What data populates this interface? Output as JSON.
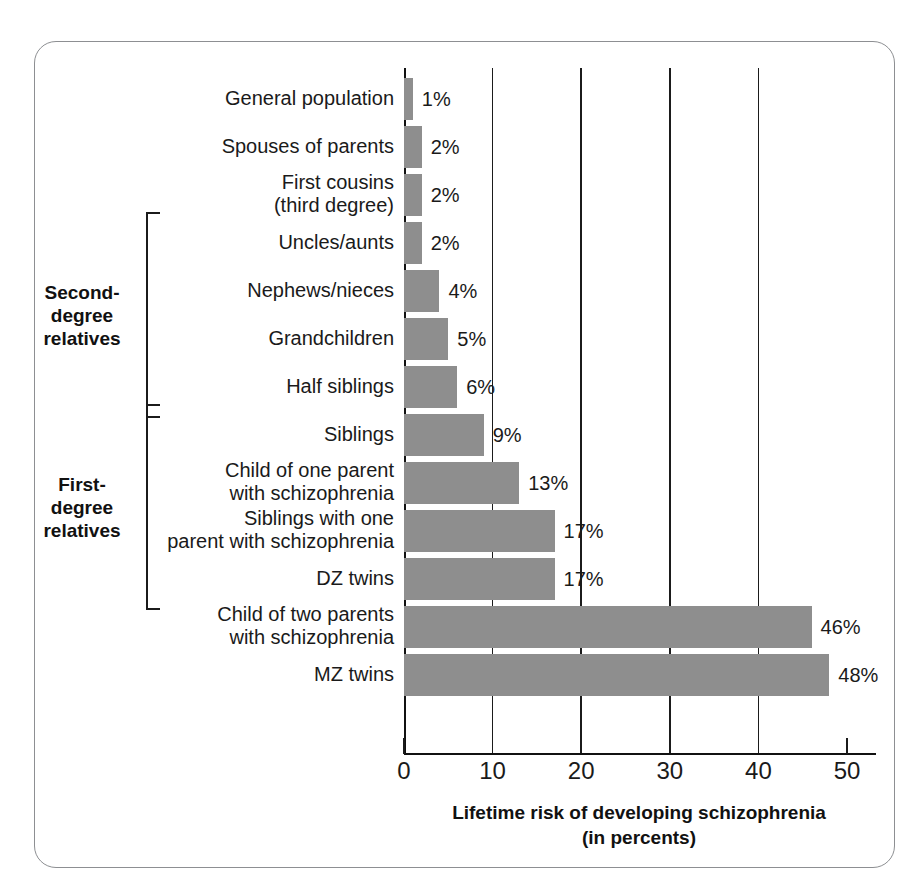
{
  "chart_data": {
    "type": "bar",
    "orientation": "horizontal",
    "title": "",
    "xlabel": "Lifetime risk of developing schizophrenia\n(in percents)",
    "ylabel": "",
    "xlim": [
      0,
      50
    ],
    "xticks": [
      0,
      10,
      20,
      30,
      40,
      50
    ],
    "xtick_labels": [
      "0",
      "10",
      "20",
      "30",
      "40",
      "50"
    ],
    "grid": true,
    "legend": false,
    "value_suffix": "%",
    "categories": [
      "General population",
      "Spouses of parents",
      "First cousins\n(third degree)",
      "Uncles/aunts",
      "Nephews/nieces",
      "Grandchildren",
      "Half siblings",
      "Siblings",
      "Child of one parent\nwith schizophrenia",
      "Siblings with one\nparent with schizophrenia",
      "DZ twins",
      "Child of two parents\nwith schizophrenia",
      "MZ twins"
    ],
    "values": [
      1,
      2,
      2,
      2,
      4,
      5,
      6,
      9,
      13,
      17,
      17,
      46,
      48
    ],
    "value_labels": [
      "1%",
      "2%",
      "2%",
      "2%",
      "4%",
      "5%",
      "6%",
      "9%",
      "13%",
      "17%",
      "17%",
      "46%",
      "48%"
    ],
    "groups": [
      {
        "label": "Second-\ndegree\nrelatives",
        "first_index": 3,
        "last_index": 6
      },
      {
        "label": "First-\ndegree\nrelatives",
        "first_index": 7,
        "last_index": 10
      }
    ],
    "colors": {
      "bar": "#8e8e8e",
      "axis": "#111111",
      "text": "#1a1a1a",
      "frame": "#8d8f92",
      "background": "#ffffff"
    }
  }
}
